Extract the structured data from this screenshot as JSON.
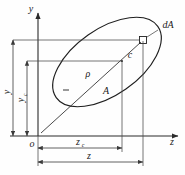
{
  "figure": {
    "background_color": "#fefefe",
    "line_color": "#1f1f1f"
  },
  "axes": {
    "vertical": {
      "label": "y",
      "name": "y-axis"
    },
    "horizontal": {
      "label": "z",
      "name": "z-axis"
    },
    "origin": {
      "label": "o",
      "name": "origin"
    }
  },
  "labels": {
    "area": "A",
    "centroid": "c",
    "element": "dA",
    "radius": "ρ",
    "dim_y": "y",
    "dim_y_sub": "c",
    "dim_yc": "y",
    "dim_yc_sub": "c",
    "dim_z": "z",
    "dim_zc": "z",
    "dim_zc_sub": "c"
  },
  "geometry": {
    "origin_px": {
      "x": 38,
      "y": 136
    },
    "centroid_px": {
      "x": 122,
      "y": 61
    },
    "element_px": {
      "x": 143,
      "y": 40
    },
    "ellipse": {
      "center_x": 107,
      "center_y": 62,
      "semi_major": 62,
      "semi_minor": 33,
      "rotation_deg": -35
    },
    "dimension_lines": [
      {
        "name": "y-total",
        "orientation": "vertical",
        "x": 13,
        "from_y": 40,
        "to_y": 136,
        "label": "y"
      },
      {
        "name": "yc",
        "orientation": "vertical",
        "x": 27,
        "from_y": 61,
        "to_y": 136,
        "label": "yc"
      },
      {
        "name": "zc",
        "orientation": "horizontal",
        "y": 148,
        "from_x": 38,
        "to_x": 122,
        "label": "zc"
      },
      {
        "name": "z-total",
        "orientation": "horizontal",
        "y": 162,
        "from_x": 38,
        "to_x": 143,
        "label": "z"
      }
    ]
  }
}
